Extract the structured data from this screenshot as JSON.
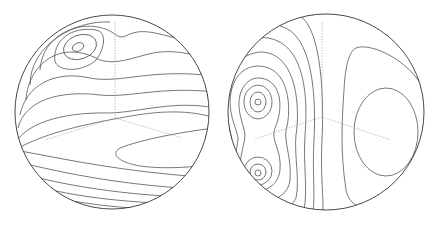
{
  "figure": {
    "panels": [
      {
        "id": "left-sphere",
        "feature": "single maximum near upper-left, bands across lower hemisphere"
      },
      {
        "id": "right-sphere",
        "feature": "two nested extrema on left side, broad closed contour on right side"
      }
    ],
    "colors": {
      "line": "#555555",
      "outline": "#333333",
      "axis": "#999999",
      "background": "#ffffff"
    }
  }
}
